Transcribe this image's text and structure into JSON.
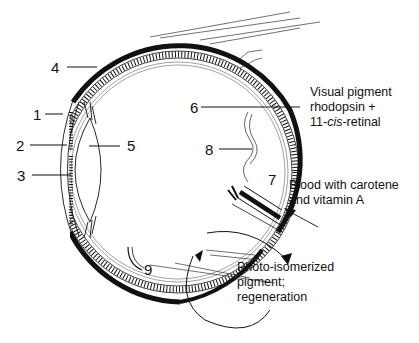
{
  "diagram": {
    "type": "eye cross-section",
    "labels": {
      "n1": "1",
      "n2": "2",
      "n3": "3",
      "n4": "4",
      "n5": "5",
      "n6": "6",
      "n7": "7",
      "n8": "8",
      "n9": "9"
    },
    "annotations": {
      "visual_pigment": {
        "line1": "Visual pigment",
        "line2": "rhodopsin +",
        "line3_prefix": "11-",
        "line3_italic": "cis",
        "line3_suffix": "-retinal"
      },
      "blood": {
        "line1": "Blood with carotene",
        "line2": "and vitamin A"
      },
      "photo": {
        "line1": "Photo-isomerized",
        "line2": "pigment;",
        "line3": "regeneration"
      }
    },
    "colors": {
      "ink": "#111111",
      "background": "#ffffff"
    }
  }
}
